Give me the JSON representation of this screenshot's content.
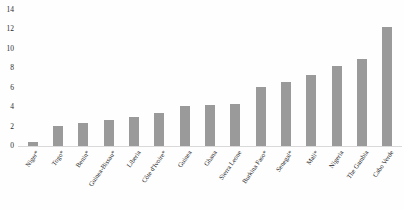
{
  "chart_data": {
    "type": "bar",
    "title": "",
    "xlabel": "",
    "ylabel": "",
    "ylim": [
      0,
      14
    ],
    "ytick_labels": [
      "14",
      "12",
      "10",
      "8",
      "6",
      "4",
      "2",
      "0"
    ],
    "ytick_values": [
      14,
      12,
      10,
      8,
      6,
      4,
      2,
      0
    ],
    "grid": false,
    "legend": "none",
    "orientation": "vertical",
    "bar_color": "#9a9a9a",
    "categories": [
      "Niger*",
      "Togo*",
      "Benin*",
      "Guinea-Bissau*",
      "Liberia",
      "Côte d'Ivoire*",
      "Guinea",
      "Ghana",
      "Sierra Leone",
      "Burkina Faso*",
      "Senegal*",
      "Mali*",
      "Nigeria",
      "The Gambia",
      "Cabo Verde"
    ],
    "values": [
      0.4,
      2.1,
      2.4,
      2.7,
      3.0,
      3.4,
      4.1,
      4.2,
      4.3,
      6.1,
      6.6,
      7.3,
      8.2,
      9.0,
      12.3
    ]
  }
}
